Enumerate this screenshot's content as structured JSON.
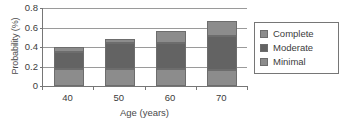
{
  "chart_data": {
    "type": "bar",
    "subtype": "stacked-bar",
    "title": "",
    "xlabel": "Age (years)",
    "ylabel": "Probability (%)",
    "categories": [
      "40",
      "50",
      "60",
      "70"
    ],
    "ylim": [
      0,
      0.8
    ],
    "yticks": [
      0.8,
      0.6,
      0.4,
      0.2,
      0
    ],
    "ytick_labels": [
      "0.8",
      "0.6",
      "0.4",
      "0.2",
      "0"
    ],
    "grid": "horizontal",
    "legend_position": "right",
    "stack_order_bottom_to_top": [
      "Minimal",
      "Moderate",
      "Complete"
    ],
    "series": [
      {
        "name": "Minimal",
        "color": "#8c8c8c",
        "values": [
          0.17,
          0.17,
          0.17,
          0.165
        ]
      },
      {
        "name": "Moderate",
        "color": "#636363",
        "values": [
          0.18,
          0.27,
          0.275,
          0.345
        ]
      },
      {
        "name": "Complete",
        "color": "#8c8c8c",
        "values": [
          0.05,
          0.04,
          0.115,
          0.155
        ]
      }
    ],
    "cumulative_tops": [
      {
        "category": "40",
        "minimal_top": 0.17,
        "moderate_top": 0.35,
        "complete_top": 0.4
      },
      {
        "category": "50",
        "minimal_top": 0.17,
        "moderate_top": 0.44,
        "complete_top": 0.48
      },
      {
        "category": "60",
        "minimal_top": 0.17,
        "moderate_top": 0.445,
        "complete_top": 0.56
      },
      {
        "category": "70",
        "minimal_top": 0.165,
        "moderate_top": 0.51,
        "complete_top": 0.665
      }
    ]
  },
  "legend": {
    "items": [
      {
        "label": "Complete",
        "color": "#8c8c8c"
      },
      {
        "label": "Moderate",
        "color": "#636363"
      },
      {
        "label": "Minimal",
        "color": "#8c8c8c"
      }
    ]
  },
  "colors": {
    "axis": "#767676",
    "gridline": "#9a9a9a",
    "bar_border": "#6d6d6d",
    "text": "#3c3c3c",
    "background": "#ffffff"
  }
}
